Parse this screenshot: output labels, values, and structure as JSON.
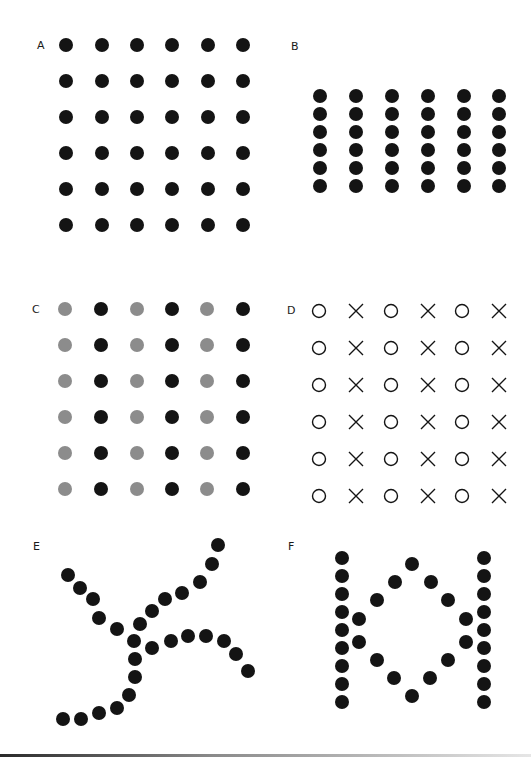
{
  "figure": {
    "width": 531,
    "height": 757,
    "colors": {
      "black": "#141414",
      "gray": "#8c8c8c",
      "background": "#ffffff"
    },
    "dot_radius": 7,
    "panels": [
      {
        "id": "A",
        "label": "A",
        "label_pos": [
          37,
          49
        ],
        "description": "6x6 evenly spaced black dots",
        "xs": [
          66,
          102,
          137,
          172,
          208,
          243
        ],
        "ys": [
          45,
          81,
          117,
          153,
          189,
          225
        ],
        "marker": "dot",
        "column_colors": [
          "black",
          "black",
          "black",
          "black",
          "black",
          "black"
        ]
      },
      {
        "id": "B",
        "label": "B",
        "label_pos": [
          291,
          50
        ],
        "description": "6 columns of 6 tightly spaced black dots",
        "xs": [
          320,
          356,
          392,
          428,
          464,
          499
        ],
        "ys": [
          96,
          114,
          132,
          150,
          168,
          186
        ],
        "marker": "dot",
        "column_colors": [
          "black",
          "black",
          "black",
          "black",
          "black",
          "black"
        ]
      },
      {
        "id": "C",
        "label": "C",
        "label_pos": [
          32,
          313
        ],
        "description": "6x6 dots alternating gray and black columns",
        "xs": [
          65,
          101,
          137,
          172,
          207,
          243
        ],
        "ys": [
          309,
          345,
          381,
          417,
          453,
          489
        ],
        "marker": "dot",
        "column_colors": [
          "gray",
          "black",
          "gray",
          "black",
          "gray",
          "black"
        ]
      },
      {
        "id": "D",
        "label": "D",
        "label_pos": [
          287,
          314
        ],
        "description": "6x6 grid alternating columns of circles and crosses",
        "xs": [
          319,
          356,
          391,
          428,
          462,
          499
        ],
        "ys": [
          311,
          348,
          385,
          422,
          459,
          496
        ],
        "column_markers": [
          "circle",
          "cross",
          "circle",
          "cross",
          "circle",
          "cross"
        ]
      },
      {
        "id": "E",
        "label": "E",
        "label_pos": [
          33,
          550
        ],
        "description": "Two crossing curved lines of dots",
        "points": [
          [
            68,
            575
          ],
          [
            80,
            588
          ],
          [
            93,
            599
          ],
          [
            99,
            618
          ],
          [
            117,
            629
          ],
          [
            134,
            641
          ],
          [
            152,
            648
          ],
          [
            171,
            641
          ],
          [
            188,
            636
          ],
          [
            206,
            636
          ],
          [
            224,
            641
          ],
          [
            236,
            654
          ],
          [
            248,
            671
          ],
          [
            218,
            545
          ],
          [
            212,
            564
          ],
          [
            200,
            582
          ],
          [
            182,
            593
          ],
          [
            165,
            599
          ],
          [
            152,
            611
          ],
          [
            140,
            624
          ],
          [
            135,
            659
          ],
          [
            135,
            677
          ],
          [
            129,
            695
          ],
          [
            117,
            708
          ],
          [
            99,
            713
          ],
          [
            81,
            719
          ],
          [
            63,
            719
          ]
        ]
      },
      {
        "id": "F",
        "label": "F",
        "label_pos": [
          288,
          550
        ],
        "description": "Two vertical dot columns enclosing a diamond of dots",
        "column_xs": [
          342,
          484
        ],
        "column_ys": [
          558,
          576,
          594,
          612,
          630,
          648,
          666,
          684,
          702
        ],
        "diamond_points": [
          [
            412,
            564
          ],
          [
            395,
            582
          ],
          [
            431,
            582
          ],
          [
            377,
            600
          ],
          [
            448,
            600
          ],
          [
            359,
            619
          ],
          [
            466,
            619
          ],
          [
            359,
            642
          ],
          [
            466,
            642
          ],
          [
            377,
            660
          ],
          [
            448,
            660
          ],
          [
            394,
            678
          ],
          [
            430,
            678
          ],
          [
            412,
            696
          ]
        ]
      }
    ]
  }
}
